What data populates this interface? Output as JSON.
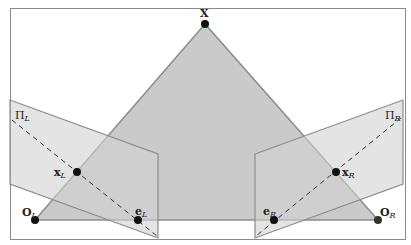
{
  "diagram": {
    "colors": {
      "background": "#ffffff",
      "border": "#8a8a8a",
      "triangle_fill": "#c4c4c4",
      "triangle_stroke": "#8c8c8c",
      "plane_fill": "#d6d6d6",
      "plane_stroke": "#8c8c8c",
      "point": "#111111",
      "dashed_line": "#333333"
    },
    "labels": {
      "X": "X",
      "O_L": {
        "main": "O",
        "sub": "L"
      },
      "O_R": {
        "main": "O",
        "sub": "R"
      },
      "x_L": {
        "main": "x",
        "sub": "L"
      },
      "x_R": {
        "main": "x",
        "sub": "R"
      },
      "e_L": {
        "main": "e",
        "sub": "L"
      },
      "e_R": {
        "main": "e",
        "sub": "R"
      },
      "Pi_L": {
        "main": "Π",
        "sub": "L"
      },
      "Pi_R": {
        "main": "Π",
        "sub": "R"
      }
    },
    "points": {
      "X": [
        205,
        24
      ],
      "O_L": [
        35,
        220
      ],
      "O_R": [
        378,
        220
      ],
      "x_L": [
        77,
        172
      ],
      "x_R": [
        336,
        172
      ],
      "e_L": [
        138,
        220
      ],
      "e_R": [
        274,
        220
      ]
    },
    "planes": {
      "left": [
        [
          10,
          100
        ],
        [
          158,
          154
        ],
        [
          158,
          238
        ],
        [
          10,
          184
        ]
      ],
      "right": [
        [
          255,
          154
        ],
        [
          403,
          100
        ],
        [
          403,
          184
        ],
        [
          255,
          238
        ]
      ]
    }
  }
}
